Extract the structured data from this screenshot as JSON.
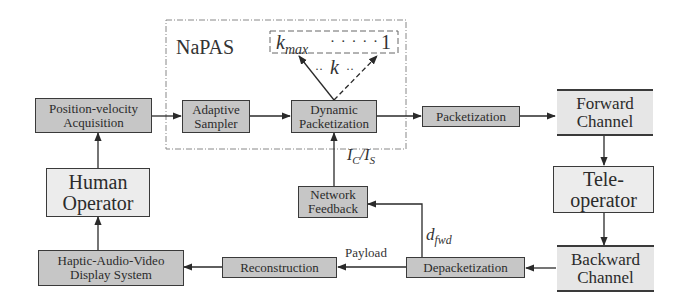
{
  "group": {
    "title": "NaPAS"
  },
  "k_range": {
    "max_label": "k",
    "max_sub": "max",
    "dots": "· · · · ·",
    "min_label": "1",
    "k_label": "k",
    "k_dots_left": "··",
    "k_dots_right": "··"
  },
  "blocks": {
    "pos_vel": {
      "line1": "Position-velocity",
      "line2": "Acquisition"
    },
    "adaptive": {
      "line1": "Adaptive",
      "line2": "Sampler"
    },
    "dynpack": {
      "line1": "Dynamic",
      "line2": "Packetization"
    },
    "pack": {
      "line1": "Packetization"
    },
    "fwd": {
      "line1": "Forward",
      "line2": "Channel"
    },
    "tele": {
      "line1": "Tele-",
      "line2": "operator"
    },
    "bwd": {
      "line1": "Backward",
      "line2": "Channel"
    },
    "depack": {
      "line1": "Depacketization"
    },
    "recon": {
      "line1": "Reconstruction"
    },
    "hav": {
      "line1": "Haptic-Audio-Video",
      "line2": "Display System"
    },
    "human": {
      "line1": "Human",
      "line2": "Operator"
    },
    "netfb": {
      "line1": "Network",
      "line2": "Feedback"
    }
  },
  "edge_labels": {
    "ic_is": {
      "a": "I",
      "a_sub": "C",
      "slash": "/",
      "b": "I",
      "b_sub": "S"
    },
    "dfwd": {
      "a": "d",
      "a_sub": "fwd"
    },
    "payload": "Payload"
  }
}
